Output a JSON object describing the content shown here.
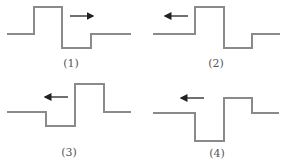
{
  "figure": {
    "colors": {
      "wave": "#8a8a8a",
      "arrow": "#222222",
      "caption": "#555555",
      "background": "#ffffff"
    },
    "panels": [
      {
        "label": "(1)",
        "arrow_direction": "right",
        "wave_shape": "pulse-up-then-down",
        "wave_path": "M7,34 L34,34 L34,7 L62,7 L62,48 L91,48 L91,34 L131,34",
        "arrow": {
          "x1": 70,
          "x2": 93,
          "y": 16
        }
      },
      {
        "label": "(2)",
        "arrow_direction": "left",
        "wave_shape": "pulse-up-then-down",
        "wave_path": "M8,34 L50,34 L50,7 L79,7 L79,48 L107,48 L107,34 L135,34",
        "arrow": {
          "x1": 43,
          "x2": 20,
          "y": 16
        }
      },
      {
        "label": "(3)",
        "arrow_direction": "left",
        "wave_shape": "pulse-down-then-up",
        "wave_path": "M7,30 L46,30 L46,44 L75,44 L75,2 L104,2 L104,30 L131,30",
        "arrow": {
          "x1": 68,
          "x2": 45,
          "y": 15
        }
      },
      {
        "label": "(4)",
        "arrow_direction": "left",
        "wave_shape": "pulse-down-then-up",
        "wave_path": "M8,31 L50,31 L50,59 L79,59 L79,16 L107,16 L107,31 L134,31",
        "arrow": {
          "x1": 59,
          "x2": 36,
          "y": 16
        }
      }
    ]
  }
}
